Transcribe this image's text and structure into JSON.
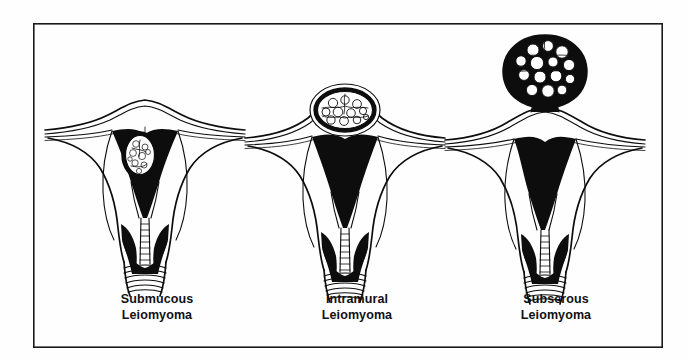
{
  "figure": {
    "kind": "medical-illustration",
    "background_color": "#fefefe",
    "ink_color": "#0d0d0d",
    "frame": {
      "visible": true,
      "color": "#1a1a1a",
      "x": 33,
      "y": 23,
      "width": 630,
      "height": 325
    }
  },
  "panels": [
    {
      "id": "submucous",
      "caption_line1": "Submucous",
      "caption_line2": "Leiomyoma",
      "caption_x": 157,
      "caption_y1": 303,
      "caption_y2": 319,
      "center_x": 145,
      "fibroid": {
        "location": "submucous-within-endometrial-cavity",
        "shape": "oval",
        "cx": 140,
        "cy": 155,
        "rx": 18,
        "ry": 23,
        "lobule_count": 9
      }
    },
    {
      "id": "intramural",
      "caption_line1": "Intramural",
      "caption_line2": "Leiomyoma",
      "caption_x": 357,
      "caption_y1": 303,
      "caption_y2": 319,
      "center_x": 345,
      "fibroid": {
        "location": "intramural-within-myometrial-wall-fundus",
        "shape": "ellipse",
        "cx": 345,
        "cy": 110,
        "rx": 33,
        "ry": 24,
        "lobule_count": 11
      }
    },
    {
      "id": "subserous",
      "caption_line1": "Subserous",
      "caption_line2": "Leiomyoma",
      "caption_x": 556,
      "caption_y1": 303,
      "caption_y2": 319,
      "center_x": 545,
      "fibroid": {
        "location": "subserous-pedunculated-above-fundus",
        "shape": "round-lobulated",
        "cx": 545,
        "cy": 72,
        "rx": 37,
        "ry": 37,
        "lobule_count": 14
      }
    }
  ],
  "anatomy_legend": {
    "endometrial_cavity": "solid black triangular cavity",
    "myometrium": "white outlined uterine wall",
    "serosa": "thin outer contour line",
    "fallopian_tubes": "thin paired horizontal lines extending laterally",
    "cervical_canal": "beaded vertical chain",
    "vagina": "horizontal rugae lines below cervix"
  }
}
